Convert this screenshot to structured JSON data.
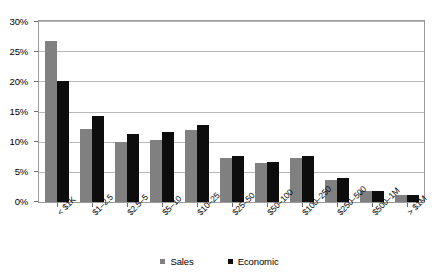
{
  "chart_data": {
    "type": "bar",
    "title": "",
    "subtitle": "",
    "xlabel": "",
    "ylabel": "",
    "ylim": [
      0,
      30
    ],
    "ytick_labels": [
      "0%",
      "5%",
      "10%",
      "15%",
      "20%",
      "25%",
      "30%"
    ],
    "yticks": [
      0,
      5,
      10,
      15,
      20,
      25,
      30
    ],
    "ytick_suffix": "%",
    "grid": true,
    "grid_axis": "y",
    "legend_position": "bottom",
    "categories": [
      "< $1K",
      "$1–2.5",
      "$2.5–5",
      "$5–10",
      "$10–25",
      "$25–50",
      "$50–100",
      "$100–250",
      "$250–500",
      "$500–1M",
      "> $1M"
    ],
    "series": [
      {
        "name": "Sales",
        "color": "#808080",
        "values": [
          26.8,
          12.1,
          10.0,
          10.4,
          12.0,
          7.4,
          6.5,
          7.4,
          3.7,
          1.8,
          1.2
        ]
      },
      {
        "name": "Economic",
        "color": "#0d0d0d",
        "values": [
          20.2,
          14.4,
          11.4,
          11.6,
          12.8,
          7.6,
          6.6,
          7.6,
          4.0,
          1.9,
          1.2
        ]
      }
    ]
  },
  "legend": {
    "items": [
      {
        "label": "Sales",
        "color": "#808080"
      },
      {
        "label": "Economic",
        "color": "#0d0d0d"
      }
    ]
  },
  "colors": {
    "sales": "#808080",
    "economic": "#0d0d0d",
    "gridline": "#b9b9b9",
    "frame": "#9a9a9a",
    "background": "#ffffff",
    "text": "#000000"
  }
}
